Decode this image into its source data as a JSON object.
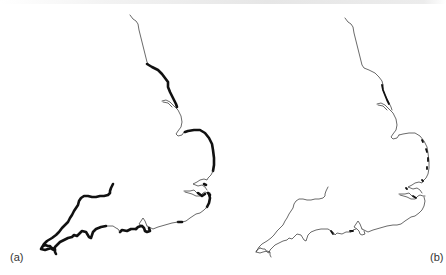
{
  "figure": {
    "panels": [
      {
        "id": "a",
        "label": "(a)",
        "highlight": "thick black segments along much of the coast"
      },
      {
        "id": "b",
        "label": "(b)",
        "highlight": "few short thick black segments"
      }
    ],
    "colors": {
      "background": "#ffffff",
      "coastline": "#444444",
      "highlight": "#111111",
      "label": "#333333"
    }
  }
}
